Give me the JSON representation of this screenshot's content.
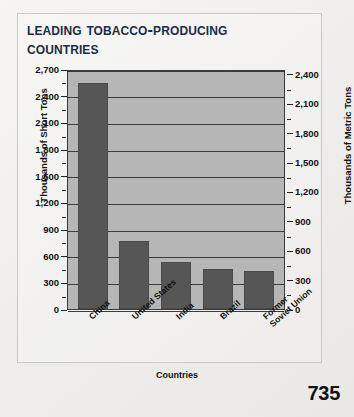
{
  "page": {
    "page_number": "735",
    "title_line1": "Leading Tobacco-Producing",
    "title_line2": "Countries"
  },
  "colors": {
    "bar": "#565656",
    "plot_background": "#b6b6b6",
    "gridline": "#3c3c3c",
    "title": "#1c2b4a",
    "page_background": "#f2f1ef"
  },
  "chart_data": {
    "type": "bar",
    "title": "Leading Tobacco-Producing Countries",
    "xlabel": "Countries",
    "ylabel": "Thousands of Short Tons",
    "ylabel_secondary": "Thousands of Metric Tons",
    "categories": [
      "China",
      "United States",
      "India",
      "Brazil",
      "Former Soviet Union"
    ],
    "values": [
      2540,
      765,
      530,
      450,
      425
    ],
    "ylim": [
      0,
      2700
    ],
    "yticks": [
      0,
      300,
      600,
      900,
      1200,
      1500,
      1800,
      2100,
      2400,
      2700
    ],
    "ytick_labels": [
      "0",
      "300",
      "600",
      "900",
      "1,200",
      "1,500",
      "1,800",
      "2,100",
      "2,400",
      "2,700"
    ],
    "ylim_secondary": [
      0,
      2450
    ],
    "yticks_secondary": [
      0,
      300,
      600,
      900,
      1200,
      1500,
      1800,
      2100,
      2400
    ],
    "ytick_labels_secondary": [
      "0",
      "300",
      "600",
      "900",
      "1,200",
      "1,500",
      "1,800",
      "2,100",
      "2,400"
    ],
    "grid": true,
    "legend": "none"
  }
}
